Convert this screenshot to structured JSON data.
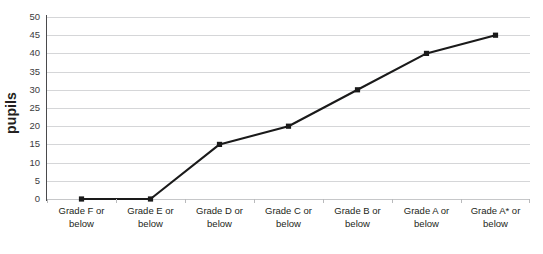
{
  "chart_data": {
    "type": "line",
    "title": "",
    "xlabel": "",
    "ylabel": "pupils",
    "ylim": [
      0,
      50
    ],
    "yticks": [
      0,
      5,
      10,
      15,
      20,
      25,
      30,
      35,
      40,
      45,
      50
    ],
    "grid": "horizontal",
    "legend": "none",
    "marker": "square",
    "line_color": "#1a1a1a",
    "gridline_color": "#d5d6d8",
    "axis_color": "#4a4a4c",
    "background": "#ffffff",
    "categories": [
      "Grade F or below",
      "Grade E or below",
      "Grade D or below",
      "Grade C or below",
      "Grade B or below",
      "Grade A or below",
      "Grade A* or below"
    ],
    "category_lines": [
      [
        "Grade F or",
        "below"
      ],
      [
        "Grade E or",
        "below"
      ],
      [
        "Grade D or",
        "below"
      ],
      [
        "Grade C or",
        "below"
      ],
      [
        "Grade B or",
        "below"
      ],
      [
        "Grade A or",
        "below"
      ],
      [
        "Grade A* or",
        "below"
      ]
    ],
    "values": [
      0,
      0,
      15,
      20,
      30,
      40,
      45
    ],
    "series": [
      {
        "name": "pupils",
        "values": [
          0,
          0,
          15,
          20,
          30,
          40,
          45
        ]
      }
    ]
  }
}
